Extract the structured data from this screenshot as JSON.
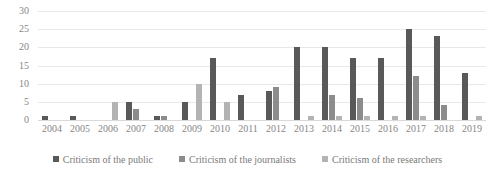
{
  "chart_data": {
    "type": "bar",
    "title": "",
    "subtitle": "",
    "xlabel": "",
    "ylabel": "",
    "ylim": [
      0,
      30
    ],
    "yticks": [
      30,
      25,
      20,
      15,
      10,
      5,
      0
    ],
    "grid": true,
    "legend_position": "bottom",
    "categories": [
      "2004",
      "2005",
      "2006",
      "2007",
      "2008",
      "2009",
      "2010",
      "2011",
      "2012",
      "2013",
      "2014",
      "2015",
      "2016",
      "2017",
      "2018",
      "2019"
    ],
    "series": [
      {
        "name": "Criticism of the public",
        "color": "#595959",
        "values": [
          1,
          1,
          0,
          5,
          1,
          5,
          17,
          7,
          8,
          20,
          20,
          17,
          17,
          25,
          23,
          13
        ]
      },
      {
        "name": "Criticism of the journalists",
        "color": "#8c8c8c",
        "values": [
          0,
          0,
          0,
          3,
          1,
          0,
          0,
          0,
          9,
          0,
          7,
          6,
          0,
          12,
          4,
          0
        ]
      },
      {
        "name": "Criticism of the researchers",
        "color": "#b3b3b3",
        "values": [
          0,
          0,
          5,
          0,
          0,
          10,
          5,
          0,
          0,
          1,
          1,
          1,
          1,
          1,
          0,
          1
        ]
      }
    ]
  },
  "legend": {
    "items": [
      {
        "label": "Criticism of the public",
        "color": "#595959"
      },
      {
        "label": "Criticism of the journalists",
        "color": "#8c8c8c"
      },
      {
        "label": "Criticism of the researchers",
        "color": "#b3b3b3"
      }
    ]
  },
  "colors": {
    "gridline": "#e8e8e8",
    "axis_text": "#868686",
    "legend_text": "#7a7a7a",
    "background": "#ffffff"
  }
}
